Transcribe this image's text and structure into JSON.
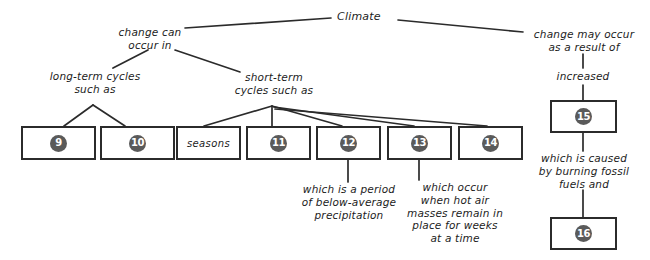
{
  "diagram": {
    "root_label": "Climate",
    "colors": {
      "stroke": "#2b2b2b",
      "badge_fill": "#5a5a5a",
      "badge_text": "#ffffff",
      "text": "#1c1c1c",
      "background": "#ffffff"
    },
    "connectors": {
      "left_branch": "change can\noccur in",
      "right_branch": "change may occur\nas a result of",
      "long_term": "long-term cycles\nsuch as",
      "short_term": "short-term\ncycles such as",
      "increased": "increased",
      "caused_by": "which is caused\nby burning fossil\nfuels and"
    },
    "boxes": [
      {
        "id": "box-9",
        "label": "9",
        "type": "number"
      },
      {
        "id": "box-10",
        "label": "10",
        "type": "number"
      },
      {
        "id": "box-seasons",
        "label": "seasons",
        "type": "text"
      },
      {
        "id": "box-11",
        "label": "11",
        "type": "number"
      },
      {
        "id": "box-12",
        "label": "12",
        "type": "number"
      },
      {
        "id": "box-13",
        "label": "13",
        "type": "number"
      },
      {
        "id": "box-14",
        "label": "14",
        "type": "number"
      },
      {
        "id": "box-15",
        "label": "15",
        "type": "number"
      },
      {
        "id": "box-16",
        "label": "16",
        "type": "number"
      }
    ],
    "annotations": [
      {
        "id": "annotation-12",
        "text": "which is a period\nof below-average\nprecipitation"
      },
      {
        "id": "annotation-13",
        "text": "which occur\nwhen hot air\nmasses remain in\nplace for weeks\nat a time"
      }
    ]
  }
}
